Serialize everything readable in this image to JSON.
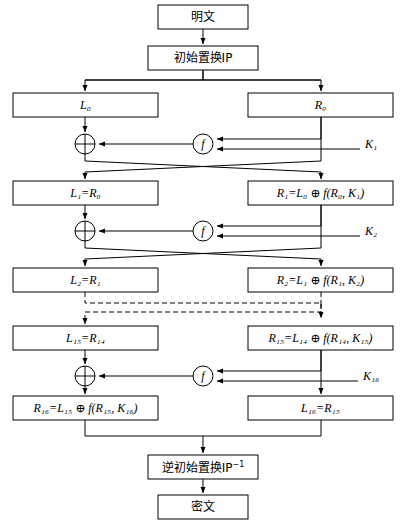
{
  "diagram": {
    "type": "feistel-network-flowchart",
    "width": 406,
    "height": 525,
    "colors": {
      "line": "#000000",
      "box_fill": "#ffffff",
      "background": "#ffffff"
    },
    "nodes": {
      "plaintext": "明文",
      "initial_permutation": "初始置换IP",
      "inverse_permutation_base": "逆初始置换IP",
      "inverse_permutation_sup": "−1",
      "ciphertext": "密文",
      "xor_symbol": "⊕",
      "f_symbol": "f"
    },
    "rounds": [
      {
        "index": 0,
        "left_label": "L",
        "left_sub": "0",
        "left_text": "L₀",
        "right_label": "R",
        "right_sub": "0",
        "right_text": "R₀",
        "key": "K",
        "key_sub": "1",
        "key_text": "K₁"
      },
      {
        "index": 1,
        "left_text": "L₁=R₀",
        "right_text": "R₁=L₀ ⊕ f(R₀, K₁)",
        "key_text": "K₂"
      },
      {
        "index": 2,
        "left_text": "L₂=R₁",
        "right_text": "R₂=L₁ ⊕ f(R₁, K₂)"
      },
      {
        "index": 15,
        "left_text": "L₁₅=R₁₄",
        "right_text": "R₁₅=L₁₄ ⊕ f(R₁₄, K₁₅)",
        "key_text": "K₁₆"
      },
      {
        "index": 16,
        "left_text": "R₁₆=L₁₅ ⊕ f(R₁₅, K₁₆)",
        "right_text": "L₁₆=R₁₅"
      }
    ],
    "boxes": {
      "plaintext": {
        "x": 158,
        "y": 5,
        "w": 90,
        "h": 24
      },
      "ip": {
        "x": 148,
        "y": 46,
        "w": 110,
        "h": 24
      },
      "L0": {
        "x": 13,
        "y": 93,
        "w": 145,
        "h": 24
      },
      "R0": {
        "x": 248,
        "y": 93,
        "w": 145,
        "h": 24
      },
      "L1": {
        "x": 13,
        "y": 181,
        "w": 145,
        "h": 24
      },
      "R1": {
        "x": 248,
        "y": 181,
        "w": 145,
        "h": 24
      },
      "L2": {
        "x": 13,
        "y": 268,
        "w": 145,
        "h": 24
      },
      "R2": {
        "x": 248,
        "y": 268,
        "w": 145,
        "h": 24
      },
      "L15": {
        "x": 13,
        "y": 326,
        "w": 145,
        "h": 24
      },
      "R15": {
        "x": 248,
        "y": 326,
        "w": 145,
        "h": 24
      },
      "R16": {
        "x": 13,
        "y": 396,
        "w": 145,
        "h": 24
      },
      "L16": {
        "x": 248,
        "y": 396,
        "w": 145,
        "h": 24
      },
      "ip_inv": {
        "x": 148,
        "y": 455,
        "w": 110,
        "h": 24
      },
      "ciphertext": {
        "x": 158,
        "y": 495,
        "w": 90,
        "h": 24
      }
    },
    "operators": {
      "xor1": {
        "cx": 85,
        "cy": 144,
        "r": 10
      },
      "f1": {
        "cx": 203,
        "cy": 144,
        "r": 10
      },
      "xor2": {
        "cx": 85,
        "cy": 231,
        "r": 10
      },
      "f2": {
        "cx": 203,
        "cy": 231,
        "r": 10
      },
      "xor3": {
        "cx": 85,
        "cy": 376,
        "r": 10
      },
      "f3": {
        "cx": 203,
        "cy": 376,
        "r": 10
      }
    },
    "key_labels": [
      {
        "name": "K1",
        "text": "K",
        "sub": "1",
        "x": 375,
        "y": 144
      },
      {
        "name": "K2",
        "text": "K",
        "sub": "2",
        "x": 375,
        "y": 231
      },
      {
        "name": "K16",
        "text": "K",
        "sub": "16",
        "x": 373,
        "y": 376
      }
    ],
    "ellipsis_note": "dashed lines indicate rounds 3 through 14 omitted"
  }
}
